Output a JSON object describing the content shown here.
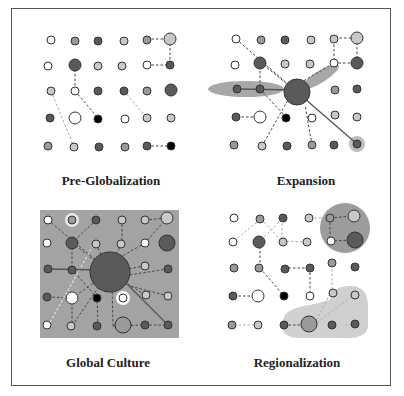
{
  "diagram": {
    "panels": [
      {
        "id": "pre-globalization",
        "title": "Pre-Globalization"
      },
      {
        "id": "expansion",
        "title": "Expansion"
      },
      {
        "id": "global-culture",
        "title": "Global Culture"
      },
      {
        "id": "regionalization",
        "title": "Regionalization"
      }
    ],
    "colors": {
      "white": "#ffffff",
      "light": "#c8c8c8",
      "mid": "#9a9a9a",
      "dark": "#5a5a5a",
      "black": "#000000",
      "highlight": "#a8a8a8",
      "region_dark": "#9c9c9c",
      "region_light": "#d0d0d0"
    }
  }
}
